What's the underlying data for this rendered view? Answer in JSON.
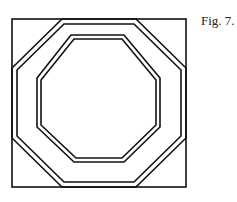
{
  "figure": {
    "caption": "Fig. 7.",
    "stroke_color": "#111111",
    "background": "#ffffff",
    "outer_square": {
      "x": 12,
      "y": 19,
      "w": 174,
      "h": 168
    },
    "outer_octagon": {
      "outer": "62,19 136,19 186,68 186,138 136,187 62,187 12,138 12,68",
      "inner": "64,24 134,24 181,70 181,136 134,182 64,182 17,136 17,70"
    },
    "inner_octagon": {
      "outer": "71,35 124,35 160,78 160,127 124,162 74,162 37,127 37,78",
      "inner": "74,39 122,39 156,80 156,125 122,158 76,158 41,125 41,80"
    }
  }
}
